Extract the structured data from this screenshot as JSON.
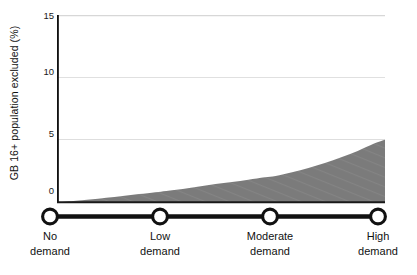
{
  "chart_data": {
    "type": "area",
    "title": "",
    "xlabel": "",
    "ylabel": "GB 16+ population excluded (%)",
    "ylim": [
      0,
      15
    ],
    "yticks": [
      0,
      5,
      10,
      15
    ],
    "ytick_labels": [
      "0",
      "5",
      "10",
      "15"
    ],
    "grid": true,
    "legend": "none",
    "categories": [
      "No demand",
      "Low demand",
      "Moderate demand",
      "High demand"
    ],
    "x": [
      0,
      1,
      2,
      3
    ],
    "series": [
      {
        "name": "GB 16+ population excluded",
        "values": [
          0,
          0.9,
          2.1,
          5.0
        ],
        "color": "#7b7b7b",
        "points": [
          {
            "x": 0.0,
            "y": 0.0
          },
          {
            "x": 0.15,
            "y": 0.1
          },
          {
            "x": 0.3,
            "y": 0.22
          },
          {
            "x": 0.45,
            "y": 0.36
          },
          {
            "x": 0.6,
            "y": 0.5
          },
          {
            "x": 0.75,
            "y": 0.65
          },
          {
            "x": 0.9,
            "y": 0.8
          },
          {
            "x": 1.0,
            "y": 0.9
          },
          {
            "x": 1.15,
            "y": 1.05
          },
          {
            "x": 1.3,
            "y": 1.25
          },
          {
            "x": 1.45,
            "y": 1.45
          },
          {
            "x": 1.6,
            "y": 1.62
          },
          {
            "x": 1.75,
            "y": 1.8
          },
          {
            "x": 1.9,
            "y": 2.0
          },
          {
            "x": 2.0,
            "y": 2.1
          },
          {
            "x": 2.15,
            "y": 2.4
          },
          {
            "x": 2.3,
            "y": 2.75
          },
          {
            "x": 2.45,
            "y": 3.15
          },
          {
            "x": 2.6,
            "y": 3.6
          },
          {
            "x": 2.75,
            "y": 4.1
          },
          {
            "x": 2.9,
            "y": 4.7
          },
          {
            "x": 3.0,
            "y": 5.0
          }
        ]
      }
    ]
  },
  "axis": {
    "y_title": "GB 16+ population excluded (%)",
    "ticks": [
      {
        "label": "15",
        "value": 15
      },
      {
        "label": "10",
        "value": 10
      },
      {
        "label": "5",
        "value": 5
      },
      {
        "label": "0",
        "value": 0
      }
    ]
  },
  "slider": {
    "stops": [
      {
        "line1": "No",
        "line2": "demand"
      },
      {
        "line1": "Low",
        "line2": "demand"
      },
      {
        "line1": "Moderate",
        "line2": "demand"
      },
      {
        "line1": "High",
        "line2": "demand"
      }
    ]
  },
  "colors": {
    "area_fill": "#7b7b7b",
    "axis": "#111111",
    "gridline": "#d9d9d9",
    "baseline": "#1a1a1a",
    "slider_track": "#111111",
    "marker_fill": "#ffffff"
  }
}
